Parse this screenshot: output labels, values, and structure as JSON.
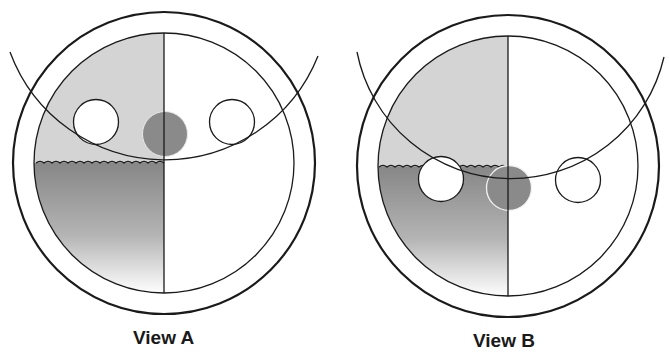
{
  "figure": {
    "views": [
      {
        "label": "View A",
        "description": "Float ball rises to meet arc above liquid surface; liquid level at center line",
        "balls": [
          {
            "type": "white",
            "position": "upper-left"
          },
          {
            "type": "gray",
            "position": "center on divider, above liquid"
          },
          {
            "type": "white",
            "position": "upper-right"
          }
        ]
      },
      {
        "label": "View B",
        "description": "Arc lowered to liquid surface; balls submerged/floating at liquid line",
        "balls": [
          {
            "type": "white",
            "position": "left, at liquid surface"
          },
          {
            "type": "gray",
            "position": "center on divider, below liquid surface"
          },
          {
            "type": "white",
            "position": "right"
          }
        ]
      }
    ],
    "colors": {
      "line": "#1a1a1a",
      "light_fill": "#d4d4d4",
      "liquid_top": "#8c8c8c",
      "liquid_bottom": "#ffffff",
      "gray_ball": "#8a8a8a",
      "background": "#ffffff"
    }
  }
}
